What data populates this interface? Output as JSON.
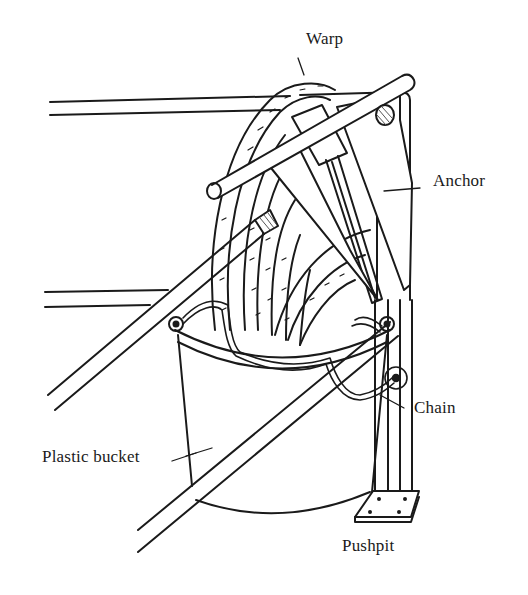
{
  "figure": {
    "labels": {
      "warp": "Warp",
      "anchor": "Anchor",
      "chain": "Chain",
      "bucket": "Plastic bucket",
      "pushpit": "Pushpit"
    },
    "colors": {
      "ink": "#1a1a1a",
      "paper": "#ffffff",
      "hatch": "#555555"
    }
  }
}
